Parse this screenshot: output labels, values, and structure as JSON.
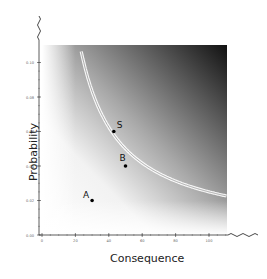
{
  "chart_data": {
    "type": "scatter",
    "title": "",
    "xlabel": "Consequence",
    "ylabel": "Probability",
    "xlim": [
      0,
      112
    ],
    "ylim": [
      0,
      0.11
    ],
    "x_ticks": [
      "0",
      "20",
      "40",
      "60",
      "80",
      "100"
    ],
    "y_ticks": [
      "0.00",
      "0.02",
      "0.04",
      "0.06",
      "0.08",
      "0.10"
    ],
    "grid": false,
    "legend": null,
    "background": "gradient from white (low risk, bottom-left) to black (high risk, top-right)",
    "axis_breaks": [
      "top of y-axis (wavy line)",
      "right end of x-axis (wavy line)"
    ],
    "points": [
      {
        "label": "A",
        "x": 30,
        "y": 0.02
      },
      {
        "label": "B",
        "x": 50,
        "y": 0.04
      },
      {
        "label": "S",
        "x": 43,
        "y": 0.06
      }
    ],
    "curves": [
      {
        "name": "iso-risk contour",
        "equation": "probability * consequence = 2.5",
        "style": "double white line"
      }
    ]
  }
}
